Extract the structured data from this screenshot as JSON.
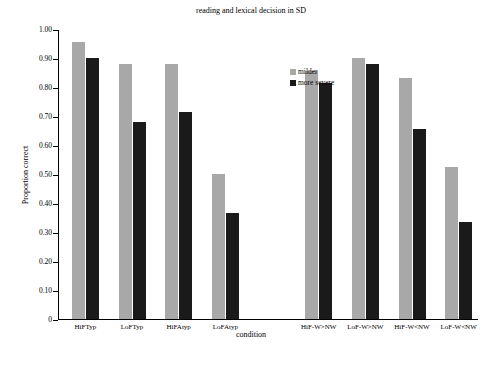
{
  "chart_data": {
    "type": "bar",
    "title": "reading and lexical decision in SD",
    "xlabel": "condition",
    "ylabel": "Proportion correct",
    "ylim": [
      0,
      1.0
    ],
    "ytick_labels": [
      "0",
      "0.10",
      "0.20",
      "0.30",
      "0.40",
      "0.50",
      "0.60",
      "0.70",
      "0.80",
      "0.90",
      "1.00"
    ],
    "ytick_values": [
      0,
      0.1,
      0.2,
      0.3,
      0.4,
      0.5,
      0.6,
      0.7,
      0.8,
      0.9,
      1.0
    ],
    "grid": false,
    "legend_position": "top-center",
    "categories": [
      "HiFTyp",
      "LoFTyp",
      "HiFAtyp",
      "LoFAtyp",
      "",
      "HiF-W>NW",
      "LoF-W>NW",
      "HiF-W<NW",
      "LoF-W<NW"
    ],
    "series": [
      {
        "name": "milder",
        "color": "#a8a8a8",
        "values": [
          0.955,
          0.88,
          0.88,
          0.5,
          null,
          0.855,
          0.9,
          0.83,
          0.525
        ]
      },
      {
        "name": "more severe",
        "color": "#1a1a1a",
        "values": [
          0.9,
          0.68,
          0.715,
          0.365,
          null,
          0.815,
          0.88,
          0.655,
          0.335
        ]
      }
    ]
  },
  "legend": {
    "entries": [
      {
        "label": "milder",
        "color": "#a8a8a8"
      },
      {
        "label": "more severe",
        "color": "#1a1a1a"
      }
    ]
  }
}
